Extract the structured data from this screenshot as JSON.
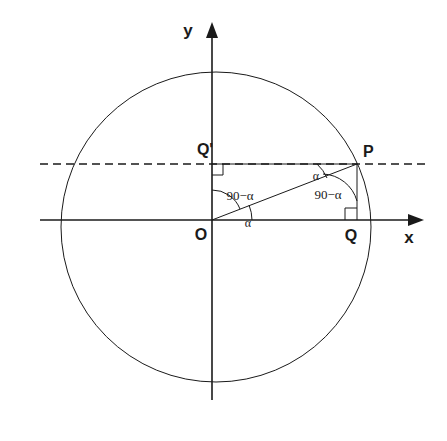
{
  "figure": {
    "background_color": "#ffffff",
    "stroke_color": "#1a1a1a"
  },
  "axes": {
    "x_label": "x",
    "y_label": "y",
    "x_axis_name": "horizontal-axis",
    "y_axis_name": "vertical-axis"
  },
  "points": {
    "origin": {
      "label": "O",
      "x": 212,
      "y": 220
    },
    "p": {
      "label": "P",
      "x": 357,
      "y": 164
    },
    "q": {
      "label": "Q",
      "x": 357,
      "y": 220
    },
    "q_prime": {
      "label": "Q'",
      "x": 212,
      "y": 164
    }
  },
  "circle": {
    "center_x": 216,
    "center_y": 227,
    "radius": 155,
    "name": "unit-circle"
  },
  "angles": {
    "at_origin_alpha": "α",
    "at_origin_complement": "90−α",
    "at_p_alpha": "α",
    "at_p_complement": "90−α"
  },
  "markers": {
    "right_angle_q": "right-angle",
    "right_angle_q_prime": "right-angle"
  },
  "lines": {
    "radius_op": "radius-segment-OP",
    "segment_pq": "segment-PQ",
    "segment_pq_prime": "segment-PQprime",
    "horizontal_dashed": "dashed-horizontal-through-P"
  }
}
